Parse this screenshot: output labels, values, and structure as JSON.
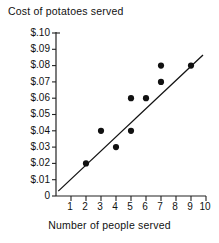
{
  "chart_data": {
    "type": "scatter",
    "title": "Cost of potatoes served",
    "xlabel": "Number of people served",
    "ylabel": "",
    "xlim": [
      0,
      10
    ],
    "ylim": [
      0,
      0.1
    ],
    "grid": false,
    "legend": "none",
    "x_ticks": [
      "1",
      "2",
      "3",
      "4",
      "5",
      "6",
      "7",
      "8",
      "9",
      "10"
    ],
    "x_tick_values": [
      1,
      2,
      3,
      4,
      5,
      6,
      7,
      8,
      9,
      10
    ],
    "y_ticks": [
      "$.10",
      "$.09",
      "$.08",
      "$.07",
      "$.06",
      "$.05",
      "$.04",
      "$.03",
      "$.02",
      "$.01",
      "0"
    ],
    "y_tick_values": [
      0.1,
      0.09,
      0.08,
      0.07,
      0.06,
      0.05,
      0.04,
      0.03,
      0.02,
      0.01,
      0
    ],
    "points": [
      {
        "x": 2,
        "y": 0.02
      },
      {
        "x": 3,
        "y": 0.04
      },
      {
        "x": 4,
        "y": 0.03
      },
      {
        "x": 5,
        "y": 0.04
      },
      {
        "x": 5,
        "y": 0.06
      },
      {
        "x": 6,
        "y": 0.06
      },
      {
        "x": 7,
        "y": 0.07
      },
      {
        "x": 7,
        "y": 0.08
      },
      {
        "x": 9,
        "y": 0.08
      }
    ],
    "trend_line": {
      "x_start": 0.15,
      "y_start": 0.003,
      "x_end": 9.8,
      "y_end": 0.0865
    },
    "marker_color": "#111111",
    "line_color": "#111111",
    "axis_color": "#222222",
    "background_color": "#ffffff"
  }
}
